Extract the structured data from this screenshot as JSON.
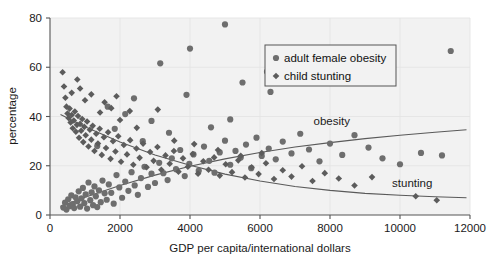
{
  "chart_data": {
    "type": "scatter",
    "title": "",
    "xlabel": "GDP per capita/international dollars",
    "ylabel": "percentage",
    "xlim": [
      0,
      12000
    ],
    "ylim": [
      0,
      80
    ],
    "xticks": [
      "0",
      "2000",
      "4000",
      "6000",
      "8000",
      "10000",
      "12000"
    ],
    "xtick_values": [
      0,
      2000,
      4000,
      6000,
      8000,
      10000,
      12000
    ],
    "yticks": [
      "0",
      "20",
      "40",
      "60",
      "80"
    ],
    "ytick_values": [
      0,
      20,
      40,
      60,
      80
    ],
    "grid": true,
    "legend_position": "top-right",
    "legend": [
      {
        "name": "adult female obesity",
        "marker": "circle",
        "color": "#6e6e6e"
      },
      {
        "name": "child stunting",
        "marker": "diamond",
        "color": "#5c5c5c"
      }
    ],
    "annotations": [
      {
        "text": "obesity",
        "x": 8050,
        "y": 36.5
      },
      {
        "text": "stunting",
        "x": 10350,
        "y": 11.5
      }
    ],
    "series": [
      {
        "name": "adult female obesity",
        "marker": "circle",
        "color": "#6e6e6e",
        "points": [
          [
            380,
            3.0
          ],
          [
            430,
            5.0
          ],
          [
            470,
            2.2
          ],
          [
            520,
            6.4
          ],
          [
            560,
            3.6
          ],
          [
            610,
            8.0
          ],
          [
            650,
            4.4
          ],
          [
            690,
            2.8
          ],
          [
            730,
            7.2
          ],
          [
            780,
            5.6
          ],
          [
            820,
            9.6
          ],
          [
            860,
            3.4
          ],
          [
            900,
            6.8
          ],
          [
            940,
            11.0
          ],
          [
            980,
            4.8
          ],
          [
            1020,
            8.4
          ],
          [
            1060,
            2.6
          ],
          [
            1100,
            13.2
          ],
          [
            1150,
            6.0
          ],
          [
            1190,
            9.2
          ],
          [
            1230,
            4.0
          ],
          [
            1270,
            11.6
          ],
          [
            1310,
            7.6
          ],
          [
            1350,
            3.2
          ],
          [
            1400,
            10.0
          ],
          [
            1450,
            5.2
          ],
          [
            1500,
            14.0
          ],
          [
            1560,
            8.8
          ],
          [
            1620,
            6.2
          ],
          [
            1680,
            12.4
          ],
          [
            1750,
            9.0
          ],
          [
            1820,
            4.6
          ],
          [
            1900,
            16.2
          ],
          [
            1980,
            11.2
          ],
          [
            2060,
            7.0
          ],
          [
            2150,
            13.6
          ],
          [
            2240,
            9.8
          ],
          [
            2330,
            17.4
          ],
          [
            2420,
            12.0
          ],
          [
            2510,
            8.2
          ],
          [
            2600,
            15.0
          ],
          [
            2700,
            19.6
          ],
          [
            2800,
            11.4
          ],
          [
            2900,
            16.8
          ],
          [
            3000,
            13.0
          ],
          [
            3120,
            21.2
          ],
          [
            3240,
            17.0
          ],
          [
            3360,
            14.2
          ],
          [
            3480,
            23.0
          ],
          [
            3600,
            18.6
          ],
          [
            3720,
            26.4
          ],
          [
            3850,
            15.8
          ],
          [
            3980,
            20.8
          ],
          [
            4100,
            24.6
          ],
          [
            4250,
            18.0
          ],
          [
            4400,
            27.8
          ],
          [
            4550,
            22.0
          ],
          [
            4700,
            17.2
          ],
          [
            4850,
            25.4
          ],
          [
            5000,
            30.2
          ],
          [
            5150,
            20.4
          ],
          [
            5300,
            26.0
          ],
          [
            5450,
            23.4
          ],
          [
            5600,
            28.6
          ],
          [
            5750,
            19.0
          ],
          [
            5900,
            31.4
          ],
          [
            6050,
            24.0
          ],
          [
            6250,
            27.0
          ],
          [
            6450,
            22.6
          ],
          [
            6650,
            29.8
          ],
          [
            6900,
            25.0
          ],
          [
            7150,
            33.0
          ],
          [
            7400,
            26.6
          ],
          [
            7700,
            21.8
          ],
          [
            8000,
            29.0
          ],
          [
            8350,
            24.4
          ],
          [
            8700,
            32.4
          ],
          [
            9100,
            27.4
          ],
          [
            9500,
            23.0
          ],
          [
            10000,
            20.6
          ],
          [
            10600,
            25.2
          ],
          [
            11200,
            24.2
          ],
          [
            11450,
            66.6
          ],
          [
            5000,
            77.4
          ],
          [
            4000,
            67.6
          ],
          [
            5500,
            53.8
          ],
          [
            6200,
            58.2
          ],
          [
            6300,
            50.0
          ],
          [
            3150,
            61.6
          ],
          [
            2400,
            47.4
          ],
          [
            3900,
            48.8
          ],
          [
            1650,
            44.0
          ],
          [
            2150,
            41.0
          ],
          [
            2900,
            38.2
          ],
          [
            1850,
            35.0
          ],
          [
            3400,
            33.4
          ],
          [
            2650,
            30.0
          ],
          [
            1350,
            28.0
          ],
          [
            4600,
            35.6
          ],
          [
            5150,
            38.8
          ]
        ]
      },
      {
        "name": "child stunting",
        "marker": "diamond",
        "color": "#5c5c5c",
        "points": [
          [
            360,
            58.0
          ],
          [
            400,
            52.2
          ],
          [
            440,
            47.6
          ],
          [
            470,
            44.0
          ],
          [
            500,
            41.2
          ],
          [
            530,
            39.4
          ],
          [
            560,
            43.2
          ],
          [
            590,
            37.6
          ],
          [
            620,
            40.6
          ],
          [
            650,
            35.2
          ],
          [
            680,
            38.4
          ],
          [
            710,
            42.0
          ],
          [
            740,
            33.8
          ],
          [
            770,
            36.6
          ],
          [
            800,
            40.2
          ],
          [
            830,
            31.4
          ],
          [
            860,
            37.0
          ],
          [
            890,
            34.2
          ],
          [
            920,
            39.0
          ],
          [
            950,
            29.6
          ],
          [
            980,
            35.8
          ],
          [
            1020,
            32.4
          ],
          [
            1060,
            38.0
          ],
          [
            1100,
            27.8
          ],
          [
            1140,
            34.6
          ],
          [
            1180,
            30.6
          ],
          [
            1220,
            36.2
          ],
          [
            1270,
            26.0
          ],
          [
            1320,
            33.0
          ],
          [
            1370,
            29.0
          ],
          [
            1420,
            35.0
          ],
          [
            1480,
            24.4
          ],
          [
            1540,
            31.6
          ],
          [
            1600,
            27.2
          ],
          [
            1660,
            33.6
          ],
          [
            1730,
            22.8
          ],
          [
            1800,
            30.0
          ],
          [
            1870,
            25.8
          ],
          [
            1950,
            32.0
          ],
          [
            2030,
            21.6
          ],
          [
            2110,
            28.4
          ],
          [
            2200,
            24.6
          ],
          [
            2290,
            30.4
          ],
          [
            2380,
            20.4
          ],
          [
            2470,
            27.0
          ],
          [
            2560,
            23.2
          ],
          [
            2660,
            29.0
          ],
          [
            2760,
            19.4
          ],
          [
            2860,
            25.6
          ],
          [
            2960,
            22.0
          ],
          [
            3070,
            27.6
          ],
          [
            3180,
            18.4
          ],
          [
            3300,
            24.2
          ],
          [
            3420,
            20.8
          ],
          [
            3540,
            26.0
          ],
          [
            3670,
            17.6
          ],
          [
            3800,
            23.0
          ],
          [
            3940,
            19.6
          ],
          [
            4080,
            24.8
          ],
          [
            4230,
            16.8
          ],
          [
            4380,
            21.8
          ],
          [
            4530,
            18.4
          ],
          [
            4690,
            23.4
          ],
          [
            4850,
            16.0
          ],
          [
            5020,
            20.6
          ],
          [
            5200,
            17.4
          ],
          [
            5380,
            22.2
          ],
          [
            5570,
            15.2
          ],
          [
            5760,
            19.4
          ],
          [
            5960,
            16.6
          ],
          [
            6170,
            21.0
          ],
          [
            6400,
            14.6
          ],
          [
            6650,
            18.2
          ],
          [
            6900,
            15.6
          ],
          [
            7200,
            19.8
          ],
          [
            7500,
            13.8
          ],
          [
            7850,
            17.0
          ],
          [
            8250,
            14.8
          ],
          [
            8700,
            12.0
          ],
          [
            9200,
            15.4
          ],
          [
            10450,
            7.6
          ],
          [
            11050,
            6.0
          ],
          [
            860,
            51.4
          ],
          [
            1180,
            49.0
          ],
          [
            1560,
            45.8
          ],
          [
            1000,
            46.6
          ],
          [
            1750,
            43.4
          ],
          [
            2280,
            42.2
          ],
          [
            2000,
            38.6
          ],
          [
            2480,
            35.4
          ],
          [
            1900,
            48.2
          ],
          [
            620,
            49.6
          ],
          [
            3080,
            42.8
          ],
          [
            3550,
            30.2
          ],
          [
            4120,
            28.8
          ],
          [
            4800,
            26.4
          ],
          [
            5450,
            24.0
          ],
          [
            6050,
            25.2
          ],
          [
            780,
            55.0
          ],
          [
            1430,
            41.6
          ]
        ]
      }
    ],
    "trend_curves": [
      {
        "name": "obesity",
        "points": [
          [
            300,
            3.5
          ],
          [
            1000,
            7.2
          ],
          [
            2000,
            12.0
          ],
          [
            3000,
            16.2
          ],
          [
            4000,
            19.8
          ],
          [
            5000,
            22.8
          ],
          [
            6000,
            25.4
          ],
          [
            7000,
            27.6
          ],
          [
            8000,
            29.4
          ],
          [
            9000,
            31.0
          ],
          [
            10000,
            32.4
          ],
          [
            11000,
            33.6
          ],
          [
            11900,
            34.6
          ]
        ]
      },
      {
        "name": "stunting",
        "points": [
          [
            300,
            40.8
          ],
          [
            1000,
            35.8
          ],
          [
            2000,
            29.6
          ],
          [
            3000,
            24.4
          ],
          [
            4000,
            20.2
          ],
          [
            5000,
            16.6
          ],
          [
            6000,
            13.8
          ],
          [
            7000,
            11.6
          ],
          [
            8000,
            10.0
          ],
          [
            9000,
            8.8
          ],
          [
            10000,
            8.0
          ],
          [
            11000,
            7.4
          ],
          [
            11900,
            7.0
          ]
        ]
      }
    ]
  }
}
